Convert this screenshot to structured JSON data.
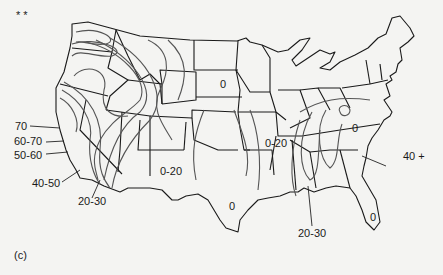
{
  "figure": {
    "panel_label": "(c)",
    "corner_marks": "* *",
    "colors": {
      "background": "#f4f4f2",
      "state_borders": "#1a1a1a",
      "isolines": "#555555"
    }
  },
  "map": {
    "region": "Contiguous United States",
    "content": "Isoline map with state boundaries",
    "labels": [
      {
        "id": "west-coast-70",
        "text": "70"
      },
      {
        "id": "west-coast-60-70",
        "text": "60-70"
      },
      {
        "id": "west-coast-50-60",
        "text": "50-60"
      },
      {
        "id": "west-coast-40-50",
        "text": "40-50"
      },
      {
        "id": "southwest-20-30",
        "text": "20-30"
      },
      {
        "id": "south-dakota-0",
        "text": "0"
      },
      {
        "id": "new-mexico-0-20",
        "text": "0-20"
      },
      {
        "id": "texas-0",
        "text": "0"
      },
      {
        "id": "missouri-0-20",
        "text": "0-20"
      },
      {
        "id": "appalachia-0",
        "text": "0"
      },
      {
        "id": "east-coast-40plus",
        "text": "40 +"
      },
      {
        "id": "gulf-20-30",
        "text": "20-30"
      },
      {
        "id": "florida-0",
        "text": "0"
      }
    ]
  }
}
